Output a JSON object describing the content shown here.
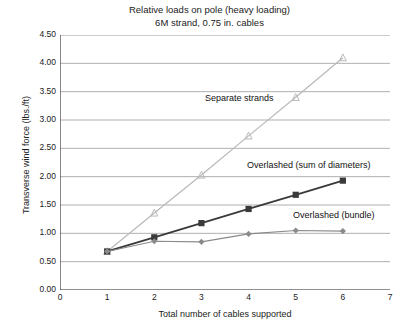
{
  "chart_data": {
    "type": "line",
    "title": "Relative loads on pole (heavy loading)",
    "subtitle": "6M strand, 0.75 in. cables",
    "xlabel": "Total number of cables supported",
    "ylabel": "Transverse wind force (lbs./ft)",
    "xlim": [
      0,
      7
    ],
    "ylim": [
      0,
      4.5
    ],
    "xticks": [
      "0",
      "1",
      "2",
      "3",
      "4",
      "5",
      "6",
      "7"
    ],
    "yticks": [
      "0.00",
      "0.50",
      "1.00",
      "1.50",
      "2.00",
      "2.50",
      "3.00",
      "3.50",
      "4.00",
      "4.50"
    ],
    "grid": true,
    "legend_position": "inline-annotations",
    "x": [
      1,
      2,
      3,
      4,
      5,
      6
    ],
    "series": [
      {
        "name": "Separate strands",
        "color": "#b9b9b9",
        "marker": "triangle",
        "values": [
          0.68,
          1.36,
          2.03,
          2.72,
          3.4,
          4.1
        ]
      },
      {
        "name": "Overlashed (sum of diameters)",
        "color": "#3a3a3a",
        "marker": "square",
        "values": [
          0.68,
          0.93,
          1.18,
          1.43,
          1.68,
          1.93
        ]
      },
      {
        "name": "Overlashed (bundle)",
        "color": "#8a8a8a",
        "marker": "diamond",
        "values": [
          0.68,
          0.86,
          0.85,
          0.99,
          1.05,
          1.04
        ]
      }
    ],
    "annotations": [
      {
        "text": "Separate strands"
      },
      {
        "text": "Overlashed (sum of diameters)"
      },
      {
        "text": "Overlashed (bundle)"
      }
    ]
  }
}
